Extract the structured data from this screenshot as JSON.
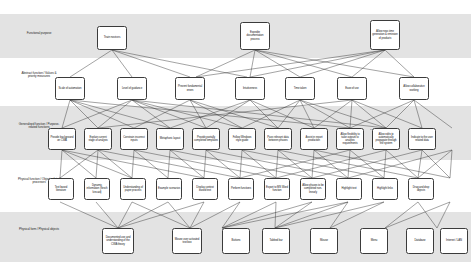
{
  "diagram": {
    "background": "#ffffff",
    "band_shaded_color": "#e3e3e3",
    "node_border_color": "#3b3b3b",
    "edge_color": "#333333",
    "levels": [
      {
        "id": "functional-purpose",
        "label": "Functional purpose"
      },
      {
        "id": "abstract-function",
        "label": "Abstract function / Values & priority measures"
      },
      {
        "id": "generalised-function",
        "label": "Generalised function / Purpose-related functions"
      },
      {
        "id": "physical-function",
        "label": "Physical function / Object-related processes"
      },
      {
        "id": "physical-form",
        "label": "Physical form / Physical objects"
      }
    ],
    "nodes": {
      "l1": [
        {
          "id": "train-novices",
          "label": "Train novices"
        },
        {
          "id": "expedite-documentation-process",
          "label": "Expedite documentation process"
        },
        {
          "id": "allow-near-time-generation",
          "label": "Allow near-time generation & emission of products"
        }
      ],
      "l2": [
        {
          "id": "scale-of-automation",
          "label": "Scale of automation"
        },
        {
          "id": "level-of-guidance",
          "label": "Level of guidance"
        },
        {
          "id": "prevent-fundamental-errors",
          "label": "Prevent fundamental errors"
        },
        {
          "id": "intuitiveness",
          "label": "Intuitiveness"
        },
        {
          "id": "time-taken",
          "label": "Time taken"
        },
        {
          "id": "ease-of-use",
          "label": "Ease of use"
        },
        {
          "id": "allow-collaborative-working",
          "label": "Allow collaborative working"
        }
      ],
      "l3": [
        {
          "id": "provide-background-on-cwa",
          "label": "Provide background on CWA"
        },
        {
          "id": "explain-current-stage-of-analysis",
          "label": "Explain current stage of analysis"
        },
        {
          "id": "constrain-incorrect-inputs",
          "label": "Constrain incorrect inputs"
        },
        {
          "id": "metaphoric-layout",
          "label": "Metaphoric layout"
        },
        {
          "id": "provide-partially-completed-templates",
          "label": "Provide partially completed templates"
        },
        {
          "id": "follow-windows-style-guide",
          "label": "Follow Windows style guide"
        },
        {
          "id": "pass-relevant-data-between-phases",
          "label": "Pass relevant data between phases"
        },
        {
          "id": "assist-in-report-production",
          "label": "Assist in report production"
        },
        {
          "id": "allow-flexibility-to-tailor-outputs",
          "label": "Allow flexibility to tailor outputs to analysis requirements"
        },
        {
          "id": "allow-edits-to-propagate",
          "label": "Allow edits to automatically propagate through the system"
        },
        {
          "id": "indicate-to-the-user-related-data",
          "label": "Indicate to the user related data"
        },
        {
          "id": "reorder-products",
          "label": "Reorder products"
        },
        {
          "id": "allow-experts-to-skip-guidance",
          "label": "Allow experts to skip guidance"
        },
        {
          "id": "share-documents-index-creation",
          "label": "Share documents (index creation)"
        }
      ],
      "l4": [
        {
          "id": "text-based-literature",
          "label": "Text based literature"
        },
        {
          "id": "dynamic-information-flesch-kincaid",
          "label": "Dynamic information (flesch kincaid)"
        },
        {
          "id": "understanding-of-paper-process",
          "label": "Understanding of paper process"
        },
        {
          "id": "example-scenarios",
          "label": "Example scenarios"
        },
        {
          "id": "display-context-based-text",
          "label": "Display context based text"
        },
        {
          "id": "perform-functions",
          "label": "Perform functions"
        },
        {
          "id": "export-to-ms-word-function",
          "label": "Export to MS Word function"
        },
        {
          "id": "allow-phases-completed-non-linearly",
          "label": "Allow phases to be completed non-linearly"
        },
        {
          "id": "highlight-text",
          "label": "Highlight text"
        },
        {
          "id": "highlight-links",
          "label": "Highlight links"
        },
        {
          "id": "drag-and-drop-objects",
          "label": "Drag and drop objects"
        },
        {
          "id": "settings-manipulation",
          "label": "Settings manipulation"
        },
        {
          "id": "store-data-locally",
          "label": "Store data locally"
        },
        {
          "id": "allow-distributed-data-transfer",
          "label": "Allow distributed data transfer"
        }
      ],
      "l5": [
        {
          "id": "documented-use-and-understanding-cwa-theory",
          "label": "Documented use and understanding of the CWA theory"
        },
        {
          "id": "mouse-over-activated-text-box",
          "label": "Mouse over activated text box"
        },
        {
          "id": "buttons",
          "label": "Buttons"
        },
        {
          "id": "tabbed-bar",
          "label": "Tabbed bar"
        },
        {
          "id": "mouse",
          "label": "Mouse"
        },
        {
          "id": "menu",
          "label": "Menu"
        },
        {
          "id": "database",
          "label": "Database"
        },
        {
          "id": "internet-lan",
          "label": "Internet / LAN"
        }
      ]
    }
  }
}
